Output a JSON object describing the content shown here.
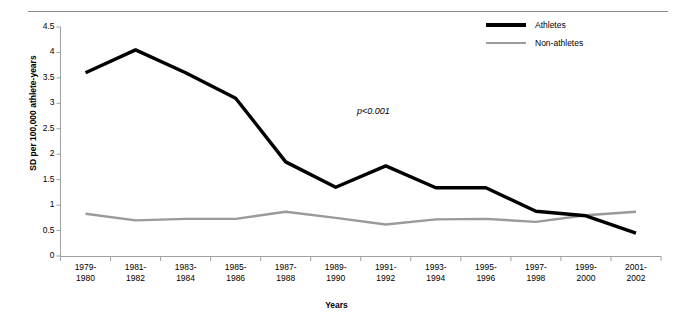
{
  "figure": {
    "top_caption": "",
    "annotation": "p<0.001"
  },
  "legend": {
    "position": "top-right",
    "items": [
      {
        "label": "Athletes",
        "color": "#000000"
      },
      {
        "label": "Non-athletes",
        "color": "#9a9a9a"
      }
    ]
  },
  "chart_data": {
    "type": "line",
    "title": "",
    "xlabel": "Years",
    "ylabel": "SD per 100,000 athlete-years",
    "ylim": [
      0,
      4.5
    ],
    "yticks": [
      "0",
      "0.5",
      "1",
      "1.5",
      "2",
      "2.5",
      "3",
      "3.5",
      "4",
      "4.5"
    ],
    "ytick_values": [
      0,
      0.5,
      1,
      1.5,
      2,
      2.5,
      3,
      3.5,
      4,
      4.5
    ],
    "grid": false,
    "legend_position": "top-right",
    "annotations": [
      "p<0.001"
    ],
    "categories": [
      "1979-1980",
      "1981-1982",
      "1983-1984",
      "1985-1986",
      "1987-1988",
      "1989-1990",
      "1991-1992",
      "1993-1994",
      "1995-1996",
      "1997-1998",
      "1999-2000",
      "2001-2002"
    ],
    "category_lines": [
      [
        "1979-",
        "1980"
      ],
      [
        "1981-",
        "1982"
      ],
      [
        "1983-",
        "1984"
      ],
      [
        "1985-",
        "1986"
      ],
      [
        "1987-",
        "1988"
      ],
      [
        "1989-",
        "1990"
      ],
      [
        "1991-",
        "1992"
      ],
      [
        "1993-",
        "1994"
      ],
      [
        "1995-",
        "1996"
      ],
      [
        "1997-",
        "1998"
      ],
      [
        "1999-",
        "2000"
      ],
      [
        "2001-",
        "2002"
      ]
    ],
    "series": [
      {
        "name": "Athletes",
        "color": "#000000",
        "values": [
          3.6,
          4.05,
          3.6,
          3.1,
          1.85,
          1.35,
          1.77,
          1.34,
          1.34,
          0.88,
          0.79,
          0.45
        ]
      },
      {
        "name": "Non-athletes",
        "color": "#9a9a9a",
        "values": [
          0.83,
          0.7,
          0.73,
          0.73,
          0.87,
          0.75,
          0.62,
          0.72,
          0.73,
          0.67,
          0.8,
          0.87
        ]
      }
    ]
  }
}
